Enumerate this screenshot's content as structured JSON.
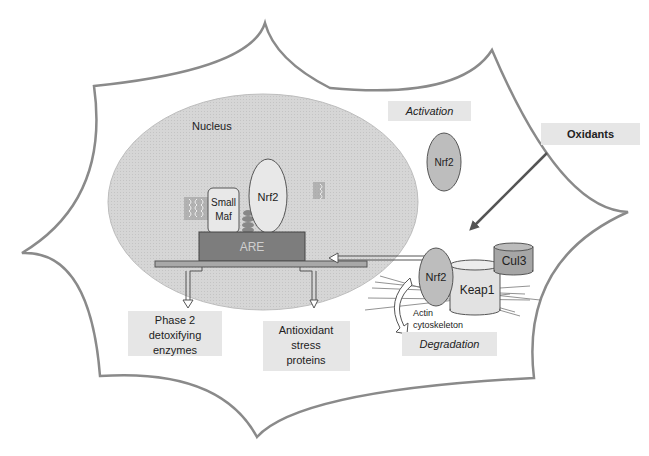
{
  "diagram": {
    "cell_label": "",
    "nucleus": {
      "label": "Nucleus"
    },
    "nuclear_complex": {
      "small_maf": {
        "line1": "Small",
        "line2": "Maf"
      },
      "nrf2": "Nrf2",
      "are": "ARE"
    },
    "outputs": {
      "phase2": {
        "line1": "Phase 2",
        "line2": "detoxifying",
        "line3": "enzymes"
      },
      "antioxidant": {
        "line1": "Antioxidant",
        "line2": "stress",
        "line3": "proteins"
      }
    },
    "activation": {
      "label": "Activation",
      "nrf2": "Nrf2"
    },
    "oxidants": {
      "label": "Oxidants"
    },
    "cytoplasm_complex": {
      "nrf2": "Nrf2",
      "keap1": "Keap1",
      "cul3": "Cul3",
      "actin_line1": "Actin",
      "actin_line2": "cytoskeleton",
      "degradation": "Degradation"
    },
    "colors": {
      "membrane": "#8a8a8a",
      "nucleus_fill": "#d4d4d4",
      "are_fill": "#7d7d7d",
      "nrf2_fill": "#bdbdbd",
      "label_box": "#e6e6e6",
      "arrow": "#555555"
    }
  }
}
